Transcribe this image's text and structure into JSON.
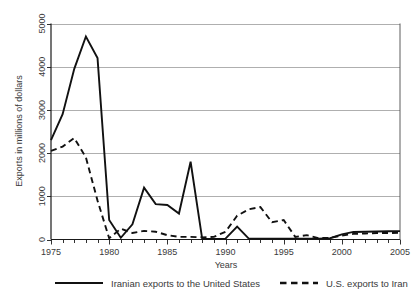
{
  "chart_data": {
    "type": "line",
    "title": "",
    "xlabel": "Years",
    "ylabel": "Exports in millions of dollars",
    "xlim": [
      1975,
      2005
    ],
    "ylim": [
      0,
      5000
    ],
    "grid": true,
    "legend_position": "bottom",
    "x": [
      1975,
      1976,
      1977,
      1978,
      1979,
      1980,
      1981,
      1982,
      1983,
      1984,
      1985,
      1986,
      1987,
      1988,
      1989,
      1990,
      1991,
      1992,
      1993,
      1994,
      1995,
      1996,
      1997,
      1998,
      1999,
      2000,
      2001,
      2002,
      2003,
      2004,
      2005
    ],
    "xticks": [
      1975,
      1980,
      1985,
      1990,
      1995,
      2000,
      2005
    ],
    "xtick_labels": [
      "1975",
      "1980",
      "1985",
      "1990",
      "1995",
      "2000",
      "2005"
    ],
    "yticks": [
      0,
      1000,
      2000,
      3000,
      4000,
      5000
    ],
    "ytick_labels": [
      "0",
      "1000",
      "2000",
      "3000",
      "4000",
      "5000"
    ],
    "series": [
      {
        "name": "Iranian exports to the United States",
        "style": "solid",
        "color": "#111111",
        "values": [
          2300,
          2900,
          3950,
          4700,
          4200,
          450,
          40,
          350,
          1200,
          820,
          800,
          600,
          1800,
          10,
          10,
          20,
          300,
          20,
          20,
          20,
          20,
          20,
          20,
          20,
          30,
          120,
          175,
          180,
          185,
          190,
          195
        ]
      },
      {
        "name": "U.S. exports to Iran",
        "style": "dashed",
        "color": "#111111",
        "values": [
          2050,
          2150,
          2350,
          1900,
          900,
          30,
          250,
          150,
          200,
          180,
          100,
          60,
          60,
          50,
          60,
          180,
          550,
          700,
          750,
          400,
          450,
          60,
          100,
          30,
          40,
          90,
          130,
          140,
          150,
          150,
          155
        ]
      }
    ]
  },
  "legend": {
    "entries": [
      {
        "label": "Iranian exports to the United States",
        "style": "solid"
      },
      {
        "label": "U.S. exports to Iran",
        "style": "dashed"
      }
    ]
  }
}
